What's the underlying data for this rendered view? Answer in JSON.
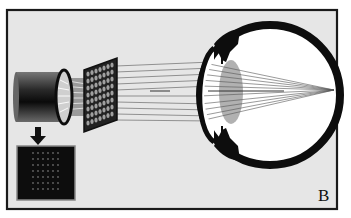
{
  "figure": {
    "panel_label": "B",
    "colors": {
      "background": "#e6e6e6",
      "frame": "#1a1a1a",
      "eye_wall": "#0d0d0d",
      "eye_interior": "#ffffff",
      "lens": "#a8a8a8",
      "rays": "#555555",
      "sensor": "#111111"
    },
    "elements": [
      {
        "name": "camera-sensor",
        "description": "cylindrical camera/sensor body"
      },
      {
        "name": "lenslet-array",
        "description": "microlens grid array"
      },
      {
        "name": "light-rays",
        "description": "parallel rays traveling to the eye"
      },
      {
        "name": "eye-cross-section",
        "description": "eyeball with crystalline lens, rays focusing on the retina"
      },
      {
        "name": "spot-pattern-inset",
        "description": "dark inset image showing a grid of spots"
      },
      {
        "name": "down-arrow",
        "description": "arrow pointing from sensor to inset"
      }
    ]
  }
}
